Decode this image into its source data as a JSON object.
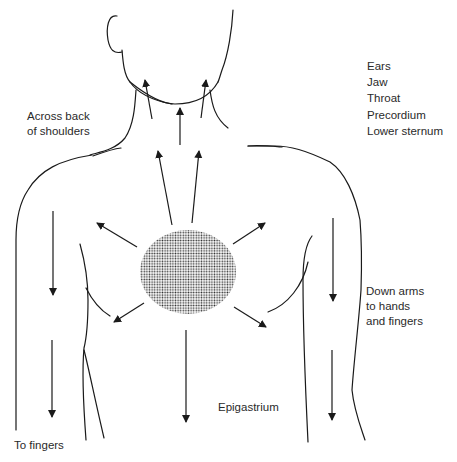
{
  "diagram": {
    "type": "anatomical-pain-radiation",
    "central_region": {
      "label": "",
      "pattern": "stippled-dots",
      "color": "#333333"
    },
    "labels": {
      "across_back_line1": "Across back",
      "across_back_line2": "of shoulders",
      "upward_sites": [
        "Ears",
        "Jaw",
        "Throat",
        "Precordium",
        "Lower sternum"
      ],
      "down_arms_line1": "Down arms",
      "down_arms_line2": "to hands",
      "down_arms_line3": "and fingers",
      "epigastrium": "Epigastrium",
      "to_fingers": "To fingers"
    },
    "arrows": [
      {
        "name": "arrow-to-left-jaw",
        "direction": "up"
      },
      {
        "name": "arrow-to-throat",
        "direction": "up"
      },
      {
        "name": "arrow-to-right-jaw",
        "direction": "up"
      },
      {
        "name": "arrow-up-left-chest",
        "direction": "up"
      },
      {
        "name": "arrow-up-right-chest",
        "direction": "up"
      },
      {
        "name": "arrow-to-left-shoulder",
        "direction": "up-left"
      },
      {
        "name": "arrow-to-right-shoulder",
        "direction": "up-right"
      },
      {
        "name": "arrow-to-left-axilla",
        "direction": "down-left"
      },
      {
        "name": "arrow-to-right-axilla",
        "direction": "down-right"
      },
      {
        "name": "arrow-to-epigastrium",
        "direction": "down"
      },
      {
        "name": "arrow-left-upper-arm",
        "direction": "down"
      },
      {
        "name": "arrow-left-forearm",
        "direction": "down"
      },
      {
        "name": "arrow-right-upper-arm",
        "direction": "down"
      },
      {
        "name": "arrow-right-forearm",
        "direction": "down"
      }
    ],
    "colors": {
      "line": "#1a1a1a",
      "text": "#2a2a2a",
      "background": "#ffffff"
    }
  }
}
